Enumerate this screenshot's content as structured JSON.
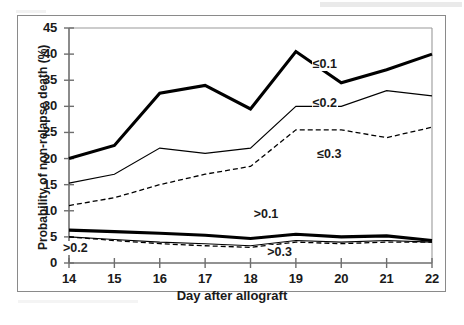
{
  "chart_data": {
    "type": "line",
    "title": "",
    "xlabel": "Day after allograft",
    "ylabel": "Probability of non-relapse death (%)",
    "x": [
      14,
      15,
      16,
      17,
      18,
      19,
      20,
      21,
      22
    ],
    "xlim": [
      14,
      22
    ],
    "ylim": [
      0,
      45
    ],
    "xticks": [
      "14",
      "15",
      "16",
      "17",
      "18",
      "19",
      "20",
      "21",
      "22"
    ],
    "yticks": [
      "0",
      "5",
      "10",
      "15",
      "20",
      "25",
      "30",
      "35",
      "40",
      "45"
    ],
    "grid": false,
    "legend": "inline-annotations",
    "series": [
      {
        "name": "≤0.1",
        "style": "solid-thick",
        "color": "#000000",
        "label_x": 19.7,
        "label_y": 38.0,
        "values": [
          20.0,
          22.5,
          32.5,
          34.0,
          29.5,
          40.5,
          34.5,
          37.0,
          40.0
        ]
      },
      {
        "name": "≤0.2",
        "style": "solid-thin",
        "color": "#000000",
        "label_x": 19.7,
        "label_y": 30.4,
        "values": [
          15.3,
          17.0,
          22.0,
          21.0,
          22.0,
          30.0,
          30.0,
          33.0,
          32.0
        ]
      },
      {
        "name": "≤0.3",
        "style": "dashed",
        "color": "#000000",
        "label_x": 19.8,
        "label_y": 20.6,
        "values": [
          11.0,
          12.5,
          15.0,
          17.0,
          18.5,
          25.5,
          25.5,
          24.0,
          26.0
        ]
      },
      {
        "name": ">0.1",
        "style": "solid-thick",
        "color": "#000000",
        "label_x": 18.4,
        "label_y": 9.2,
        "values": [
          6.3,
          6.0,
          5.7,
          5.3,
          4.7,
          5.5,
          5.0,
          5.2,
          4.3
        ]
      },
      {
        "name": ">0.2",
        "style": "solid-thin",
        "color": "#000000",
        "label_x": 14.2,
        "label_y": 2.6,
        "values": [
          5.0,
          4.5,
          4.0,
          3.7,
          3.3,
          4.3,
          4.0,
          4.3,
          4.0
        ]
      },
      {
        "name": ">0.3",
        "style": "dashed",
        "color": "#000000",
        "label_x": 18.7,
        "label_y": 1.9,
        "values": [
          5.0,
          4.3,
          3.7,
          3.3,
          3.0,
          4.0,
          3.7,
          4.0,
          4.0
        ]
      }
    ]
  },
  "axes": {
    "x_title": "Day after allograft",
    "y_title": "Probability of non-relapse death (%)",
    "x_tick_labels": [
      "14",
      "15",
      "16",
      "17",
      "18",
      "19",
      "20",
      "21",
      "22"
    ],
    "y_tick_labels": [
      "45",
      "40",
      "35",
      "30",
      "25",
      "20",
      "15",
      "10",
      "5",
      "0"
    ]
  },
  "annotations": [
    {
      "text": "≤0.1"
    },
    {
      "text": "≤0.2"
    },
    {
      "text": "≤0.3"
    },
    {
      "text": ">0.1"
    },
    {
      "text": ">0.2"
    },
    {
      "text": ">0.3"
    }
  ],
  "colors": {
    "line": "#000000",
    "axis": "#6e6e6e",
    "frame": "#8a8a8a",
    "background": "#ffffff"
  }
}
